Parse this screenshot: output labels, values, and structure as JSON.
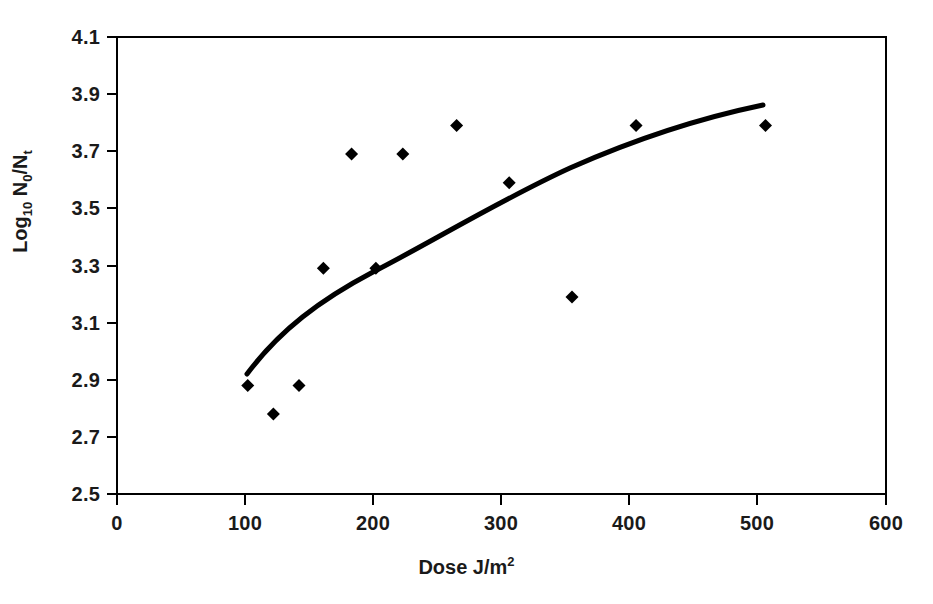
{
  "chart_data": {
    "type": "scatter",
    "title": "",
    "subtitle": "",
    "xlabel": "Dose J/m",
    "xlabel_sup": "2",
    "ylabel_main": "Log",
    "ylabel_sub1": "10",
    "ylabel_mid": " N",
    "ylabel_sub2": "0",
    "ylabel_sep": "/N",
    "ylabel_sub3": "t",
    "xlim": [
      0,
      600
    ],
    "ylim": [
      2.5,
      4.1
    ],
    "xticks": [
      0,
      100,
      200,
      300,
      400,
      500,
      600
    ],
    "xtick_labels": [
      "0",
      "100",
      "200",
      "300",
      "400",
      "500",
      "600"
    ],
    "yticks": [
      2.5,
      2.7,
      2.9,
      3.1,
      3.3,
      3.5,
      3.7,
      3.9,
      4.1
    ],
    "ytick_labels": [
      "2.5",
      "2.7",
      "2.9",
      "3.1",
      "3.3",
      "3.5",
      "3.7",
      "3.9",
      "4.1"
    ],
    "grid": false,
    "legend": false,
    "legend_position": "none",
    "marker": "diamond",
    "marker_color": "#000000",
    "line_color": "#000000",
    "axis_color": "#000000",
    "background_color": "#ffffff",
    "x": [
      102,
      122,
      142,
      161,
      183,
      202,
      223,
      265,
      306,
      355,
      405,
      506
    ],
    "y": [
      2.88,
      2.78,
      2.88,
      3.29,
      3.69,
      3.29,
      3.69,
      3.79,
      3.59,
      3.19,
      3.79,
      3.79
    ],
    "points": [
      {
        "x": 102,
        "y": 2.88
      },
      {
        "x": 122,
        "y": 2.78
      },
      {
        "x": 142,
        "y": 2.88
      },
      {
        "x": 161,
        "y": 3.29
      },
      {
        "x": 183,
        "y": 3.69
      },
      {
        "x": 202,
        "y": 3.29
      },
      {
        "x": 223,
        "y": 3.69
      },
      {
        "x": 265,
        "y": 3.79
      },
      {
        "x": 306,
        "y": 3.59
      },
      {
        "x": 355,
        "y": 3.19
      },
      {
        "x": 405,
        "y": 3.79
      },
      {
        "x": 506,
        "y": 3.79
      }
    ],
    "series": [
      {
        "name": "data",
        "type": "scatter",
        "values": [
          2.88,
          2.78,
          2.88,
          3.29,
          3.69,
          3.29,
          3.69,
          3.79,
          3.59,
          3.19,
          3.79,
          3.79
        ]
      },
      {
        "name": "fitted curve",
        "type": "line",
        "x": [
          102,
          130,
          160,
          190,
          220,
          250,
          280,
          310,
          340,
          370,
          400,
          430,
          460,
          500
        ],
        "values": [
          2.93,
          3.05,
          3.16,
          3.25,
          3.33,
          3.4,
          3.46,
          3.52,
          3.57,
          3.62,
          3.67,
          3.71,
          3.75,
          3.86
        ]
      }
    ]
  }
}
